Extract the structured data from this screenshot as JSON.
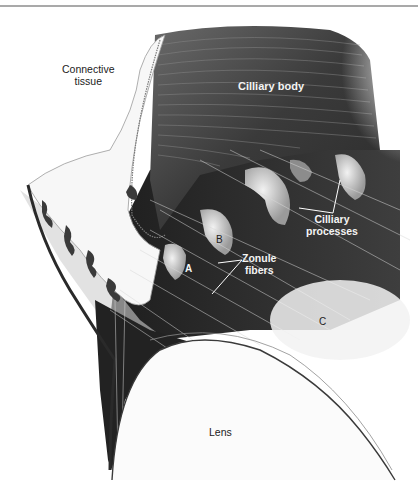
{
  "figure": {
    "type": "anatomical illustration",
    "colors": {
      "background": "#ffffff",
      "rule": "#a9a9a9",
      "dark_tissue": "#2a2a2a",
      "mid_tissue": "#5a5a5a",
      "light_tissue": "#e8e8e8",
      "label_dark": "#222222",
      "label_light": "#f4f4f4"
    },
    "labels": {
      "connective_tissue_line1": "Connective",
      "connective_tissue_line2": "tissue",
      "ciliary_body": "Cilliary body",
      "ciliary_processes_line1": "Cilliary",
      "ciliary_processes_line2": "processes",
      "zonule_fibers_line1": "Zonule",
      "zonule_fibers_line2": "fibers",
      "lens": "Lens"
    },
    "letters": {
      "a": "A",
      "b": "B",
      "c": "C"
    }
  }
}
